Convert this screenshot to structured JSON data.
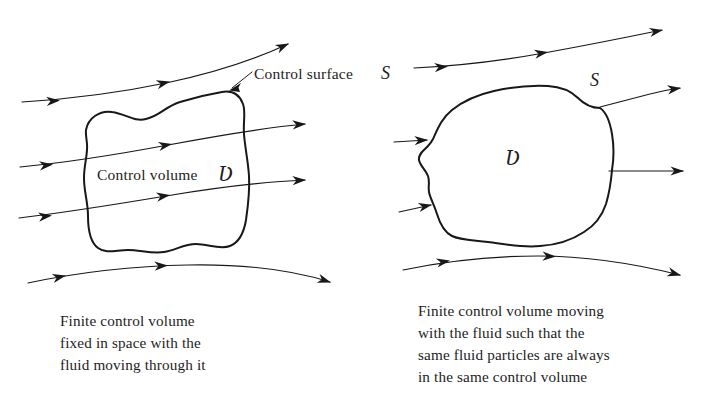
{
  "figure": {
    "background_color": "#ffffff",
    "ink_color": "#181818",
    "panels": [
      {
        "id": "fixed-control-volume",
        "position": "left",
        "labels": {
          "control_surface": "Control surface",
          "control_surface_symbol": "S",
          "control_volume": "Control volume",
          "control_volume_symbol": "Ʋ"
        },
        "caption_lines": [
          "Finite control volume",
          "fixed in space with the",
          "fluid moving through it"
        ],
        "streamline_count": 4,
        "boundary_style": "wavy-lobed-closed-curve"
      },
      {
        "id": "moving-control-volume",
        "position": "right",
        "labels": {
          "control_surface_symbol": "S",
          "control_volume_symbol": "Ʋ"
        },
        "caption_lines": [
          "Finite control volume moving",
          "with the fluid such that the",
          "same fluid particles are always",
          "in the same control volume"
        ],
        "streamline_count": 5,
        "boundary_style": "irregular-blob-closed-curve"
      }
    ]
  }
}
